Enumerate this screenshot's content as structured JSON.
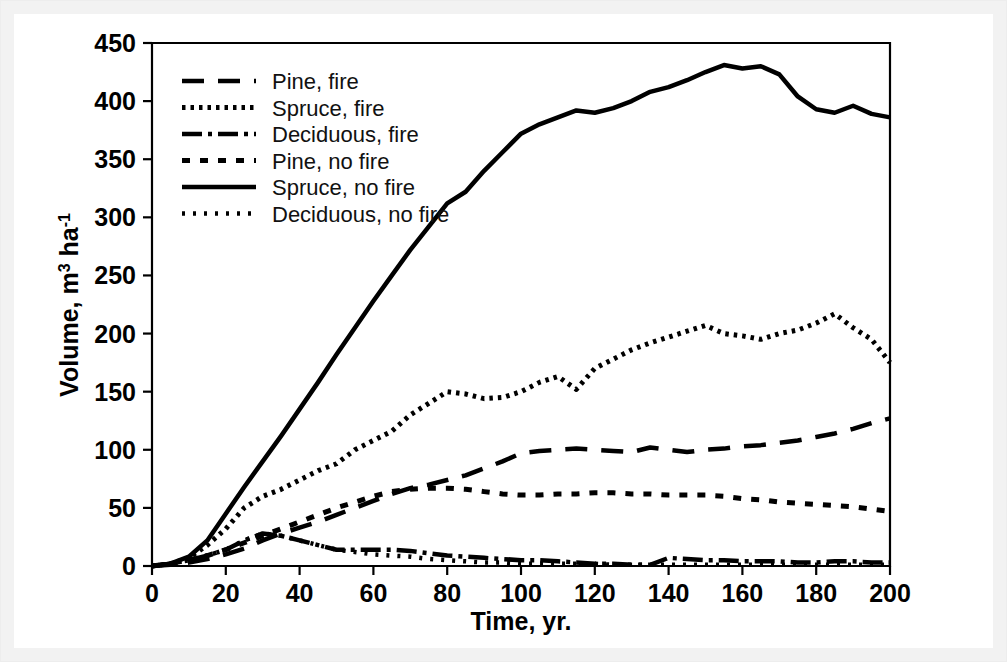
{
  "figure": {
    "background_color": "#ffffff",
    "frame_color": "#f2f2f2",
    "line_color": "#000000"
  },
  "axes": {
    "y_title_main": "Volume, m",
    "y_title_sup1": "3",
    "y_title_mid": " ha",
    "y_title_sup2": "-1",
    "x_title": "Time, yr.",
    "y_ticks": [
      "0",
      "50",
      "100",
      "150",
      "200",
      "250",
      "300",
      "350",
      "400",
      "450"
    ],
    "x_ticks": [
      "0",
      "20",
      "40",
      "60",
      "80",
      "100",
      "120",
      "140",
      "160",
      "180",
      "200"
    ]
  },
  "legend": {
    "items": [
      {
        "label": "Pine, fire",
        "style": "long-dash",
        "dash": "22 14",
        "width": 4.5
      },
      {
        "label": "Spruce, fire",
        "style": "fine-dots",
        "dash": "3.5 5",
        "width": 5
      },
      {
        "label": "Deciduous, fire",
        "style": "dash-dot",
        "dash": "20 6 4 6",
        "width": 4.5
      },
      {
        "label": "Pine, no fire",
        "style": "short-dash",
        "dash": "8 10",
        "width": 5
      },
      {
        "label": "Spruce, no fire",
        "style": "solid",
        "dash": "",
        "width": 4.5
      },
      {
        "label": "Deciduous, no fire",
        "style": "small-dots",
        "dash": "3 8",
        "width": 4.5
      }
    ]
  },
  "chart_data": {
    "type": "line",
    "title": "",
    "xlabel": "Time, yr.",
    "ylabel": "Volume, m3 ha-1",
    "xlim": [
      0,
      200
    ],
    "ylim": [
      0,
      450
    ],
    "xtick_step": 20,
    "ytick_step": 50,
    "grid": false,
    "legend_position": "upper-left-inside",
    "x": [
      0,
      5,
      10,
      15,
      20,
      25,
      30,
      35,
      40,
      45,
      50,
      55,
      60,
      65,
      70,
      75,
      80,
      85,
      90,
      95,
      100,
      105,
      110,
      115,
      120,
      125,
      130,
      135,
      140,
      145,
      150,
      155,
      160,
      165,
      170,
      175,
      180,
      185,
      190,
      195,
      200
    ],
    "series": [
      {
        "name": "Pine, fire",
        "style": "long-dash",
        "values": [
          0,
          1,
          3,
          6,
          10,
          15,
          22,
          28,
          33,
          38,
          44,
          50,
          56,
          62,
          67,
          70,
          74,
          78,
          84,
          90,
          97,
          99,
          100,
          101,
          100,
          99,
          98,
          102,
          100,
          98,
          100,
          101,
          103,
          104,
          106,
          108,
          111,
          114,
          118,
          123,
          127
        ]
      },
      {
        "name": "Spruce, fire",
        "style": "fine-dots",
        "values": [
          0,
          2,
          7,
          18,
          32,
          50,
          60,
          66,
          74,
          82,
          88,
          100,
          108,
          116,
          130,
          140,
          150,
          148,
          144,
          145,
          150,
          158,
          163,
          152,
          170,
          178,
          186,
          192,
          197,
          202,
          207,
          200,
          198,
          195,
          200,
          203,
          209,
          217,
          205,
          195,
          175
        ]
      },
      {
        "name": "Deciduous, fire",
        "style": "dash-dot",
        "values": [
          0,
          2,
          5,
          9,
          14,
          22,
          28,
          26,
          22,
          18,
          14,
          14,
          14,
          14,
          13,
          11,
          9,
          8,
          7,
          6,
          5,
          5,
          4,
          3,
          2,
          2,
          1,
          1,
          7,
          6,
          5,
          5,
          4,
          4,
          4,
          3,
          3,
          4,
          4,
          3,
          3
        ]
      },
      {
        "name": "Pine, no fire",
        "style": "short-dash",
        "values": [
          0,
          2,
          5,
          9,
          14,
          20,
          26,
          32,
          38,
          44,
          50,
          55,
          60,
          64,
          66,
          67,
          67,
          66,
          64,
          62,
          61,
          61,
          62,
          62,
          63,
          63,
          62,
          62,
          61,
          61,
          61,
          60,
          58,
          57,
          55,
          54,
          53,
          52,
          51,
          49,
          47
        ]
      },
      {
        "name": "Spruce, no fire",
        "style": "solid",
        "values": [
          0,
          2,
          8,
          22,
          45,
          68,
          90,
          112,
          135,
          158,
          182,
          205,
          228,
          250,
          272,
          292,
          312,
          322,
          340,
          356,
          372,
          380,
          386,
          392,
          390,
          394,
          400,
          408,
          412,
          418,
          425,
          431,
          428,
          430,
          423,
          404,
          393,
          390,
          396,
          389,
          386
        ]
      },
      {
        "name": "Deciduous, no fire",
        "style": "small-dots",
        "values": [
          0,
          2,
          5,
          9,
          14,
          22,
          28,
          26,
          22,
          18,
          14,
          12,
          10,
          9,
          8,
          6,
          5,
          4,
          3,
          3,
          2,
          2,
          2,
          2,
          2,
          1,
          1,
          1,
          1,
          1,
          1,
          1,
          1,
          1,
          1,
          1,
          1,
          1,
          1,
          1,
          1
        ]
      }
    ]
  }
}
